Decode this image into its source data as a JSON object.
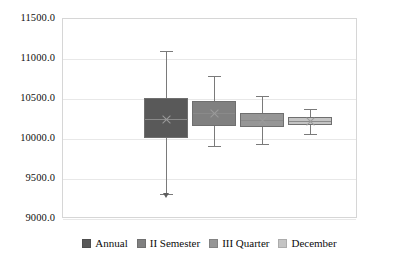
{
  "chart_data": {
    "type": "box",
    "title": "",
    "xlabel": "",
    "ylabel": "",
    "ylim": [
      9000.0,
      11500.0
    ],
    "grid": true,
    "legend_position": "bottom",
    "ytick_labels": [
      "11500.0",
      "11000.0",
      "10500.0",
      "10000.0",
      "9500.0",
      "9000.0"
    ],
    "ytick_values": [
      11500.0,
      11000.0,
      10500.0,
      10000.0,
      9500.0,
      9000.0
    ],
    "categories": [
      "Annual",
      "II  Semester",
      "III Quarter",
      "December"
    ],
    "series": [
      {
        "name": "Annual",
        "color": "#595959",
        "whisker_high": 11100.0,
        "q3": 10513.0,
        "median": 10250.0,
        "q1": 10013.0,
        "whisker_low": 9313.0,
        "outlier_low": 9300.0
      },
      {
        "name": "II  Semester",
        "color": "#808080",
        "whisker_high": 10788.0,
        "q3": 10475.0,
        "median": 10325.0,
        "q1": 10163.0,
        "whisker_low": 9913.0,
        "outlier_low": null
      },
      {
        "name": "III Quarter",
        "color": "#969696",
        "whisker_high": 10538.0,
        "q3": 10325.0,
        "median": 10238.0,
        "q1": 10150.0,
        "whisker_low": 9938.0,
        "outlier_low": null
      },
      {
        "name": "December",
        "color": "#c4c4c4",
        "whisker_high": 10375.0,
        "q3": 10275.0,
        "median": 10225.0,
        "q1": 10175.0,
        "whisker_low": 10063.0,
        "outlier_low": null
      }
    ]
  },
  "legend": {
    "items": [
      {
        "label": "Annual",
        "color": "#595959"
      },
      {
        "label": "II  Semester",
        "color": "#808080"
      },
      {
        "label": "III Quarter",
        "color": "#969696"
      },
      {
        "label": "December",
        "color": "#c4c4c4"
      }
    ]
  }
}
